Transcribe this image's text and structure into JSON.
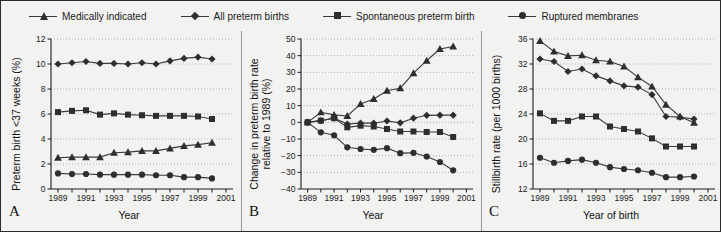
{
  "figure": {
    "width": 721,
    "height": 232,
    "background": "#f2f2f0",
    "border_color": "#2b2b2b"
  },
  "legend": {
    "position": "top",
    "items": [
      {
        "label": "Medically indicated",
        "marker": "triangle-up-marker",
        "color": "#2e2e2e"
      },
      {
        "label": "All preterm births",
        "marker": "diamond-marker",
        "color": "#2e2e2e"
      },
      {
        "label": "Spontaneous preterm birth",
        "marker": "square-marker",
        "color": "#2e2e2e"
      },
      {
        "label": "Ruptured membranes",
        "marker": "circle-marker",
        "color": "#2e2e2e"
      }
    ]
  },
  "panels": [
    {
      "letter": "A",
      "xlabel": "Year",
      "ylabel": "Preterm birth <37 weeks (%)"
    },
    {
      "letter": "B",
      "xlabel": "Year",
      "ylabel_line1": "Change in preterm birth rate",
      "ylabel_line2": "relative to 1989 (%)"
    },
    {
      "letter": "C",
      "xlabel": "Year of birth",
      "ylabel": "Stillbirth rate (per 1000 births)"
    }
  ],
  "chart_data": [
    {
      "type": "line",
      "panel": "A",
      "title": "",
      "xlabel": "Year",
      "ylabel": "Preterm birth <37 weeks (%)",
      "x": [
        1989,
        1990,
        1991,
        1992,
        1993,
        1994,
        1995,
        1996,
        1997,
        1998,
        1999,
        2000
      ],
      "xlim": [
        1988.5,
        2001.5
      ],
      "xticks": [
        1989,
        1990,
        1991,
        1992,
        1993,
        1994,
        1995,
        1996,
        1997,
        1998,
        1999,
        2000,
        2001
      ],
      "xticklabels": [
        "1989",
        "",
        "1991",
        "",
        "1993",
        "",
        "1995",
        "",
        "1997",
        "",
        "1999",
        "",
        "2001"
      ],
      "ylim": [
        0,
        12
      ],
      "yticks": [
        0,
        2,
        4,
        6,
        8,
        10,
        12
      ],
      "grid": true,
      "legend_position": "figure-top",
      "series": [
        {
          "name": "All preterm births",
          "marker": "diamond",
          "values": [
            10.0,
            10.1,
            10.2,
            10.05,
            10.05,
            10.0,
            10.1,
            10.0,
            10.25,
            10.45,
            10.55,
            10.4
          ]
        },
        {
          "name": "Spontaneous preterm birth",
          "marker": "square",
          "values": [
            6.15,
            6.25,
            6.3,
            5.95,
            6.05,
            5.95,
            5.9,
            5.85,
            5.85,
            5.85,
            5.8,
            5.6
          ]
        },
        {
          "name": "Medically indicated",
          "marker": "triangle",
          "values": [
            2.5,
            2.55,
            2.55,
            2.55,
            2.9,
            2.95,
            3.05,
            3.05,
            3.25,
            3.45,
            3.55,
            3.7
          ]
        },
        {
          "name": "Ruptured membranes",
          "marker": "circle",
          "values": [
            1.25,
            1.2,
            1.2,
            1.15,
            1.15,
            1.15,
            1.15,
            1.1,
            1.1,
            0.95,
            0.95,
            0.85
          ]
        }
      ]
    },
    {
      "type": "line",
      "panel": "B",
      "title": "",
      "xlabel": "Year",
      "ylabel": "Change in preterm birth rate relative to 1989 (%)",
      "x": [
        1989,
        1990,
        1991,
        1992,
        1993,
        1994,
        1995,
        1996,
        1997,
        1998,
        1999,
        2000
      ],
      "xlim": [
        1988.5,
        2001.5
      ],
      "xticks": [
        1989,
        1990,
        1991,
        1992,
        1993,
        1994,
        1995,
        1996,
        1997,
        1998,
        1999,
        2000,
        2001
      ],
      "xticklabels": [
        "1989",
        "",
        "1991",
        "",
        "1993",
        "",
        "1995",
        "",
        "1997",
        "",
        "1999",
        "",
        "2001"
      ],
      "ylim": [
        -40,
        50
      ],
      "yticks": [
        -40,
        -30,
        -20,
        -10,
        0,
        10,
        20,
        30,
        40,
        50
      ],
      "grid": true,
      "legend_position": "figure-top",
      "series": [
        {
          "name": "Medically indicated",
          "marker": "triangle",
          "values": [
            0,
            6.0,
            4.5,
            3.8,
            11.0,
            14.0,
            19.0,
            20.5,
            29.5,
            37.0,
            44.0,
            45.5
          ]
        },
        {
          "name": "All preterm births",
          "marker": "diamond",
          "values": [
            0,
            1.0,
            2.5,
            -1.0,
            -0.5,
            -0.5,
            0.8,
            -0.3,
            2.5,
            4.2,
            4.3,
            4.3
          ]
        },
        {
          "name": "Spontaneous preterm birth",
          "marker": "square",
          "values": [
            0,
            1.0,
            2.5,
            -3.0,
            -2.0,
            -2.5,
            -4.0,
            -5.5,
            -5.5,
            -5.8,
            -5.8,
            -8.8
          ]
        },
        {
          "name": "Ruptured membranes",
          "marker": "circle",
          "values": [
            0,
            -6.0,
            -7.8,
            -15.0,
            -16.0,
            -16.5,
            -15.5,
            -18.5,
            -18.3,
            -20.5,
            -23.8,
            -28.8
          ]
        }
      ]
    },
    {
      "type": "line",
      "panel": "C",
      "title": "",
      "xlabel": "Year of birth",
      "ylabel": "Stillbirth rate (per 1000 births)",
      "x": [
        1989,
        1990,
        1991,
        1992,
        1993,
        1994,
        1995,
        1996,
        1997,
        1998,
        1999,
        2000
      ],
      "xlim": [
        1988.5,
        2001.5
      ],
      "xticks": [
        1989,
        1990,
        1991,
        1992,
        1993,
        1994,
        1995,
        1996,
        1997,
        1998,
        1999,
        2000,
        2001
      ],
      "xticklabels": [
        "1989",
        "",
        "1991",
        "",
        "1993",
        "",
        "1995",
        "",
        "1997",
        "",
        "1999",
        "",
        "2001"
      ],
      "ylim": [
        12,
        36
      ],
      "yticks": [
        12,
        16,
        20,
        24,
        28,
        32,
        36
      ],
      "grid": true,
      "legend_position": "figure-top",
      "series": [
        {
          "name": "Medically indicated",
          "marker": "triangle",
          "values": [
            35.7,
            34.0,
            33.3,
            33.4,
            32.6,
            32.4,
            31.6,
            29.9,
            28.4,
            25.5,
            23.6,
            22.6
          ]
        },
        {
          "name": "All preterm births",
          "marker": "diamond",
          "values": [
            32.8,
            32.4,
            30.8,
            31.2,
            30.1,
            29.3,
            28.5,
            28.3,
            27.1,
            23.6,
            23.5,
            23.2
          ]
        },
        {
          "name": "Spontaneous preterm birth",
          "marker": "square",
          "values": [
            24.1,
            22.9,
            22.9,
            23.6,
            23.6,
            22.0,
            21.6,
            21.2,
            20.1,
            18.8,
            18.8,
            18.8
          ]
        },
        {
          "name": "Ruptured membranes",
          "marker": "circle",
          "values": [
            17.0,
            16.2,
            16.5,
            16.7,
            16.2,
            15.5,
            15.2,
            15.0,
            14.6,
            13.9,
            13.9,
            14.0
          ]
        }
      ]
    }
  ]
}
